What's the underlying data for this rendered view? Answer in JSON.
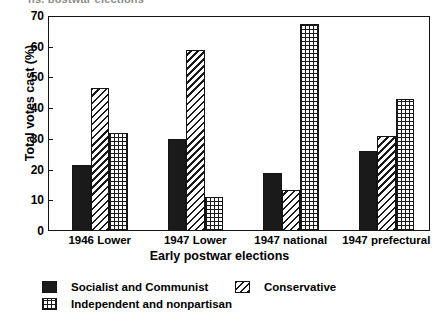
{
  "clipped_title": "ns, postwar elections",
  "chart_data": {
    "type": "bar",
    "title": "",
    "xlabel": "Early postwar elections",
    "ylabel": "Total votes cast (%)",
    "ylim": [
      0,
      70
    ],
    "ytick_step": 10,
    "yticks": [
      0,
      10,
      20,
      30,
      40,
      50,
      60,
      70
    ],
    "ytick_labels": [
      "0",
      "10",
      "20",
      "30",
      "40",
      "50",
      "60",
      "70"
    ],
    "grid": false,
    "legend_position": "below-axes",
    "categories": [
      "1946 Lower",
      "1947 Lower",
      "1947 national",
      "1947 prefectural"
    ],
    "series": [
      {
        "name": "Socialist and Communist",
        "fill": "solid-black",
        "values": [
          21.5,
          30,
          19,
          26
        ]
      },
      {
        "name": "Conservative",
        "fill": "diagonal-hatch",
        "values": [
          46.5,
          59,
          13.5,
          31
        ]
      },
      {
        "name": "Independent and nonpartisan",
        "fill": "crosshatch",
        "values": [
          32,
          11,
          67.5,
          43
        ]
      }
    ]
  },
  "colors": {
    "ink": "#1a1a1a",
    "frame": "#141414",
    "background": "#ffffff"
  }
}
